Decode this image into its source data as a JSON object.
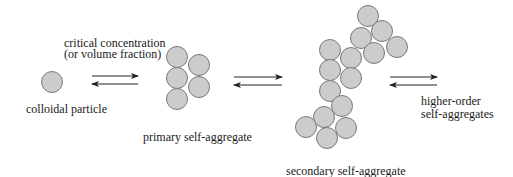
{
  "diagram": {
    "colors": {
      "particle_fill": "#cccccc",
      "particle_stroke": "#7a7a7a",
      "arrow": "#222222",
      "text": "#1a1a1a",
      "background": "#ffffff"
    },
    "labels": {
      "colloidal_particle": "colloidal particle",
      "critical_line1": "critical concentration",
      "critical_line2": "(or volume fraction)",
      "primary": "primary self-aggregate",
      "secondary": "secondary self-aggregate",
      "higher_line1": "higher-order",
      "higher_line2": "self-aggregates"
    },
    "nodes": [
      {
        "id": "colloidal-particle",
        "particle_count": 1
      },
      {
        "id": "primary-self-aggregate",
        "particle_count": 5
      },
      {
        "id": "secondary-self-aggregate",
        "particle_count": 15
      },
      {
        "id": "higher-order-self-aggregates",
        "particle_count": 0
      }
    ],
    "edges": [
      {
        "from": "colloidal-particle",
        "to": "primary-self-aggregate",
        "type": "equilibrium",
        "label": "critical concentration (or volume fraction)"
      },
      {
        "from": "primary-self-aggregate",
        "to": "secondary-self-aggregate",
        "type": "equilibrium"
      },
      {
        "from": "secondary-self-aggregate",
        "to": "higher-order-self-aggregates",
        "type": "equilibrium"
      }
    ]
  }
}
